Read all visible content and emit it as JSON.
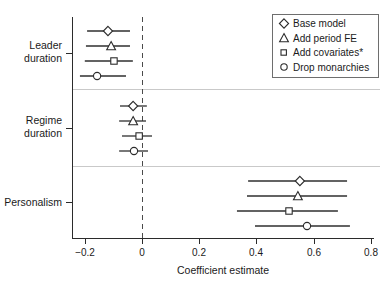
{
  "chart_data": {
    "type": "scatter",
    "title": "",
    "xlabel": "Coefficient estimate",
    "ylabel": "",
    "xlim": [
      -0.28,
      0.82
    ],
    "xticks": [
      -0.2,
      0,
      0.2,
      0.4,
      0.6,
      0.8
    ],
    "xticklabels": [
      "−0.2",
      "0",
      "0.2",
      "0.4",
      "0.6",
      "0.8"
    ],
    "grid": false,
    "reference_line": {
      "value": 0,
      "style": "dashed"
    },
    "legend_position": "top-right",
    "orientation": "horizontal",
    "categories": [
      "Leader duration",
      "Regime duration",
      "Personalism"
    ],
    "series": [
      {
        "name": "Base model",
        "marker": "diamond",
        "values": [
          -0.119,
          -0.031,
          0.552
        ],
        "ci_low": [
          -0.192,
          -0.077,
          0.371
        ],
        "ci_high": [
          -0.042,
          0.017,
          0.717
        ]
      },
      {
        "name": "Add period FE",
        "marker": "triangle",
        "values": [
          -0.108,
          -0.031,
          0.545
        ],
        "ci_low": [
          -0.196,
          -0.08,
          0.367
        ],
        "ci_high": [
          -0.042,
          0.014,
          0.717
        ]
      },
      {
        "name": "Add covariates*",
        "marker": "square",
        "values": [
          -0.098,
          -0.01,
          0.514
        ],
        "ci_low": [
          -0.2,
          -0.07,
          0.332
        ],
        "ci_high": [
          -0.032,
          0.035,
          0.685
        ]
      },
      {
        "name": "Drop monarchies",
        "marker": "circle",
        "values": [
          -0.157,
          -0.028,
          0.577
        ],
        "ci_low": [
          -0.217,
          -0.08,
          0.395
        ],
        "ci_high": [
          -0.056,
          0.021,
          0.727
        ]
      }
    ]
  },
  "axis": {
    "x_title": "Coefficient estimate",
    "tick_labels": [
      "−0.2",
      "0",
      "0.2",
      "0.4",
      "0.6",
      "0.8"
    ]
  },
  "categories": [
    {
      "line1": "Leader",
      "line2": "duration"
    },
    {
      "line1": "Regime",
      "line2": "duration"
    },
    {
      "line1": "Personalism",
      "line2": ""
    }
  ],
  "legend": {
    "items": [
      {
        "label": "Base model",
        "marker": "diamond"
      },
      {
        "label": "Add period FE",
        "marker": "triangle"
      },
      {
        "label": "Add covariates*",
        "marker": "square"
      },
      {
        "label": "Drop monarchies",
        "marker": "circle"
      }
    ]
  }
}
